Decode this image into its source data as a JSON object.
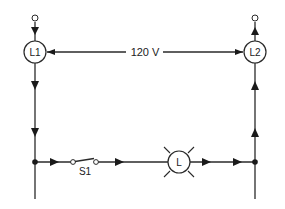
{
  "diagram": {
    "type": "circuit-schematic",
    "supply_voltage_label": "120 V",
    "components": {
      "line1": {
        "label": "L1"
      },
      "line2": {
        "label": "L2"
      },
      "switch": {
        "label": "S1"
      },
      "lamp": {
        "label": "L"
      }
    },
    "colors": {
      "wire": "#2a2a2a",
      "background": "#ffffff"
    }
  }
}
